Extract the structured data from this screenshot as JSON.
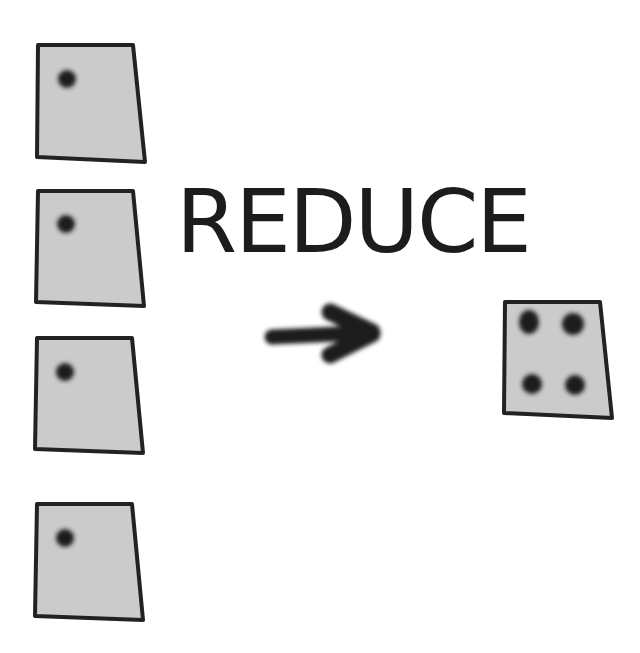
{
  "diagram": {
    "label": "REDUCE",
    "colors": {
      "card_fill": "#cbcbcb",
      "card_stroke": "#222222",
      "dot": "#1e1e1e",
      "arrow": "#1a1a1a",
      "text": "#1c1c1c",
      "background": "#ffffff"
    },
    "input_cards": [
      {
        "id": "input-card-1",
        "dots": 1
      },
      {
        "id": "input-card-2",
        "dots": 1
      },
      {
        "id": "input-card-3",
        "dots": 1
      },
      {
        "id": "input-card-4",
        "dots": 1
      }
    ],
    "arrow": {
      "direction": "right"
    },
    "output_card": {
      "id": "output-card",
      "dots": 4
    }
  }
}
